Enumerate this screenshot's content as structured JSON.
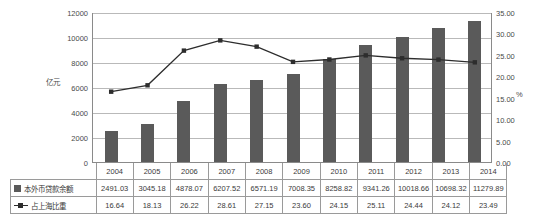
{
  "chart_data": {
    "type": "bar",
    "title": "",
    "categories": [
      "2004",
      "2005",
      "2006",
      "2007",
      "2008",
      "2009",
      "2010",
      "2011",
      "2012",
      "2013",
      "2014"
    ],
    "series": [
      {
        "name": "本外币贷款余额",
        "type": "bar",
        "axis": "left",
        "unit": "亿元",
        "color": "#5a5a5a",
        "values": [
          2491.03,
          3045.18,
          4878.07,
          6207.52,
          6571.19,
          7008.35,
          8258.82,
          9341.26,
          10018.66,
          10698.32,
          11279.89
        ]
      },
      {
        "name": "占上海比重",
        "type": "line",
        "axis": "right",
        "unit": "%",
        "color": "#2d2d2d",
        "values": [
          16.64,
          18.13,
          26.22,
          28.61,
          27.15,
          23.6,
          24.15,
          25.11,
          24.44,
          24.12,
          23.49
        ]
      }
    ],
    "xlabel": "",
    "ylabel": "亿元",
    "y2label": "%",
    "ylim": [
      0,
      12000
    ],
    "y2lim": [
      0,
      35
    ],
    "yticks": [
      "0",
      "2000",
      "4000",
      "6000",
      "8000",
      "10000",
      "12000"
    ],
    "y2ticks": [
      "0.00",
      "5.00",
      "10.00",
      "15.00",
      "20.00",
      "25.00",
      "30.00",
      "35.00"
    ],
    "grid": true,
    "legend_position": "data-table"
  },
  "axes": {
    "left_unit": "亿元",
    "right_unit": "%",
    "left_ticks": [
      "12000",
      "10000",
      "8000",
      "6000",
      "4000",
      "2000",
      "0"
    ],
    "right_ticks": [
      "35.00",
      "30.00",
      "25.00",
      "20.00",
      "15.00",
      "10.00",
      "5.00",
      "0.00"
    ]
  },
  "table": {
    "years": [
      "2004",
      "2005",
      "2006",
      "2007",
      "2008",
      "2009",
      "2010",
      "2011",
      "2012",
      "2013",
      "2014"
    ],
    "rows": [
      {
        "label": "本外币贷款余额",
        "key": "square",
        "values": [
          "2491.03",
          "3045.18",
          "4878.07",
          "6207.52",
          "6571.19",
          "7008.35",
          "8258.82",
          "9341.26",
          "10018.66",
          "10698.32",
          "11279.89"
        ]
      },
      {
        "label": "占上海比重",
        "key": "line-marker",
        "values": [
          "16.64",
          "18.13",
          "26.22",
          "28.61",
          "27.15",
          "23.60",
          "24.15",
          "25.11",
          "24.44",
          "24.12",
          "23.49"
        ]
      }
    ]
  }
}
